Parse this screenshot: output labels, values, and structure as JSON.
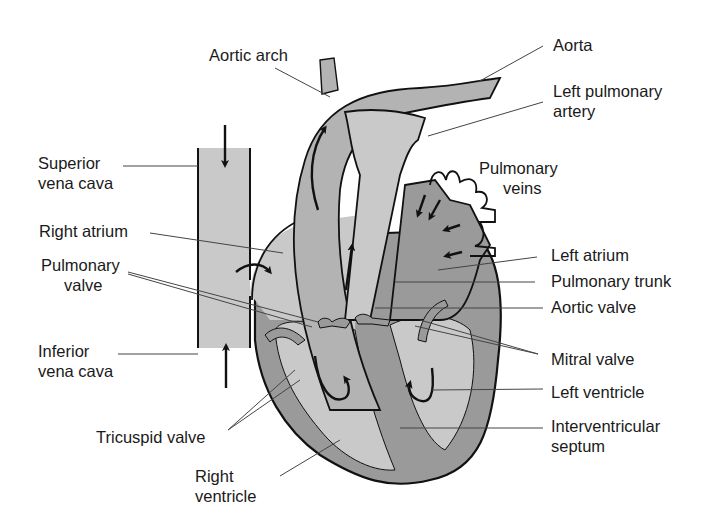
{
  "diagram": {
    "colors": {
      "background": "#ffffff",
      "light_fill": "#c9c9c9",
      "dark_fill": "#9a9a9a",
      "outline": "#111111",
      "leader_line": "#444444",
      "text": "#1a1a1a"
    },
    "labels": {
      "aortic_arch": "Aortic arch",
      "aorta": "Aorta",
      "left_pulmonary_artery_1": "Left pulmonary",
      "left_pulmonary_artery_2": "artery",
      "superior_vena_cava_1": "Superior",
      "superior_vena_cava_2": "vena cava",
      "pulmonary_veins_1": "Pulmonary",
      "pulmonary_veins_2": "veins",
      "right_atrium": "Right atrium",
      "pulmonary_valve_1": "Pulmonary",
      "pulmonary_valve_2": "valve",
      "left_atrium": "Left atrium",
      "pulmonary_trunk": "Pulmonary trunk",
      "aortic_valve": "Aortic valve",
      "inferior_vena_cava_1": "Inferior",
      "inferior_vena_cava_2": "vena cava",
      "mitral_valve": "Mitral valve",
      "left_ventricle": "Left ventricle",
      "tricuspid_valve": "Tricuspid valve",
      "interventricular_septum_1": "Interventricular",
      "interventricular_septum_2": "septum",
      "right_ventricle_1": "Right",
      "right_ventricle_2": "ventricle"
    }
  }
}
